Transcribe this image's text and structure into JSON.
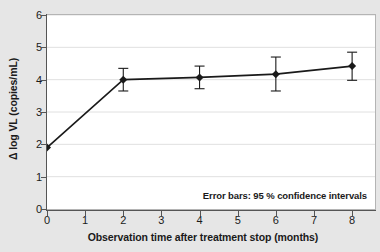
{
  "chart_data": {
    "type": "line",
    "title": "",
    "xlabel": "Observation time after treatment stop (months)",
    "ylabel": "Δ log VL (copies/mL)",
    "xlim": [
      0,
      8.6
    ],
    "ylim": [
      0,
      6
    ],
    "xticks": [
      0,
      1,
      2,
      3,
      4,
      5,
      6,
      7,
      8
    ],
    "xtick_labels": [
      "0",
      "1",
      "2",
      "3",
      "4",
      "5",
      "6",
      "7",
      "8"
    ],
    "yticks": [
      0,
      1,
      2,
      3,
      4,
      5,
      6
    ],
    "ytick_labels": [
      "0",
      "1",
      "2",
      "3",
      "4",
      "5",
      "6"
    ],
    "grid": "horizontal",
    "legend": "none",
    "annotation": "Error bars: 95 % confidence intervals",
    "marker": "diamond",
    "line_color": "#1a1a1a",
    "marker_color": "#1a1a1a",
    "grid_color": "#e0e0e0",
    "plot_bg": "#ffffff",
    "figure_bg": "#e6e6e6",
    "x": [
      0,
      2,
      4,
      6,
      8
    ],
    "values": [
      1.9,
      4.0,
      4.07,
      4.17,
      4.42
    ],
    "ci_low": [
      1.9,
      3.65,
      3.72,
      3.65,
      3.98
    ],
    "ci_high": [
      1.9,
      4.35,
      4.42,
      4.7,
      4.85
    ],
    "series": [
      {
        "name": "Δ log VL",
        "values": [
          1.9,
          4.0,
          4.07,
          4.17,
          4.42
        ]
      }
    ],
    "points": [
      {
        "x": 0,
        "y": 1.9,
        "ci_low": 1.9,
        "ci_high": 1.9
      },
      {
        "x": 2,
        "y": 4.0,
        "ci_low": 3.65,
        "ci_high": 4.35
      },
      {
        "x": 4,
        "y": 4.07,
        "ci_low": 3.72,
        "ci_high": 4.42
      },
      {
        "x": 6,
        "y": 4.17,
        "ci_low": 3.65,
        "ci_high": 4.7
      },
      {
        "x": 8,
        "y": 4.42,
        "ci_low": 3.98,
        "ci_high": 4.85
      }
    ]
  }
}
